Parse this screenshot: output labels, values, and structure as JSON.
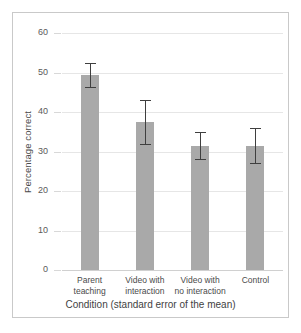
{
  "chart_data": {
    "type": "bar",
    "title": "",
    "xlabel": "Condition (standard error of the mean)",
    "ylabel": "Percentage correct",
    "categories": [
      "Parent teaching",
      "Video with interaction",
      "Video with no interaction",
      "Control"
    ],
    "category_lines": [
      [
        "Parent",
        "teaching"
      ],
      [
        "Video with",
        "interaction"
      ],
      [
        "Video with",
        "no interaction"
      ],
      [
        "Control",
        ""
      ]
    ],
    "values": [
      49.3,
      37.5,
      31.5,
      31.5
    ],
    "errors": [
      3.0,
      5.5,
      3.5,
      4.5
    ],
    "error_type": "standard error of the mean",
    "ylim": [
      0,
      60
    ],
    "yticks": [
      0,
      10,
      20,
      30,
      40,
      50,
      60
    ],
    "ytick_labels": [
      "0",
      "10",
      "20",
      "30",
      "40",
      "50",
      "60"
    ],
    "grid": true,
    "legend": null,
    "colors": {
      "bar_fill": "#a9a9a9",
      "error_bar": "#3f3f3f",
      "gridline": "#e6e6e6",
      "frame": "#c9c9c9",
      "text": "#4a4a4a",
      "background": "#ffffff"
    }
  }
}
